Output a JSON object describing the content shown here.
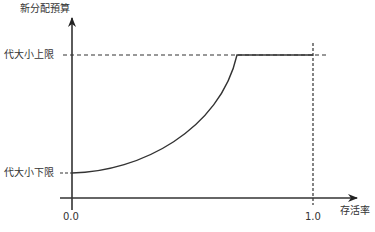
{
  "diagram": {
    "y_axis_label": "新分配預算",
    "x_axis_label": "存活率",
    "upper_limit_label": "代大小上限",
    "lower_limit_label": "代大小下限",
    "x_tick_start": "0.0",
    "x_tick_end": "1.0",
    "line_color": "#333333"
  }
}
